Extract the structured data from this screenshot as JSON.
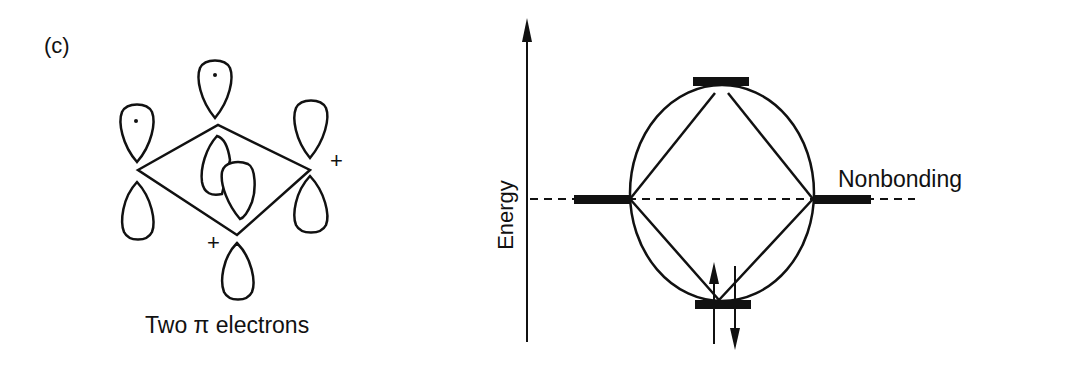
{
  "panel_label": "(c)",
  "left_figure": {
    "caption": "Two π electrons",
    "plus_signs": [
      "+",
      "+"
    ],
    "description": "Cyclobutadiene-like ring with p orbitals, dots mark unpaired-electron lobes"
  },
  "right_figure": {
    "y_axis_label": "Energy",
    "level_label": "Nonbonding",
    "levels": [
      {
        "name": "top",
        "electrons": 0
      },
      {
        "name": "nonbonding-left",
        "electrons": 0
      },
      {
        "name": "nonbonding-right",
        "electrons": 0
      },
      {
        "name": "bottom",
        "electrons": 2
      }
    ]
  },
  "colors": {
    "ink": "#111111",
    "background": "#ffffff"
  }
}
